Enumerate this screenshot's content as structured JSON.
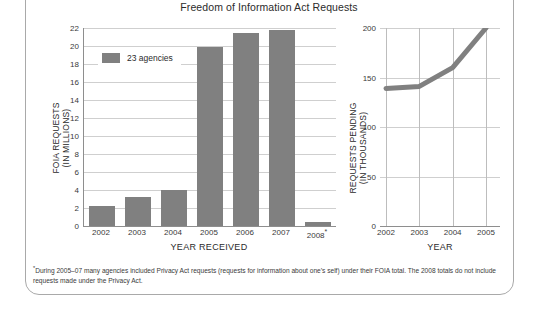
{
  "title": "Freedom of Information Act Requests",
  "colors": {
    "bar": "#808080",
    "line": "#808080",
    "grid": "#cfcfcf",
    "axis": "#8e8e8e",
    "frame": "#a9a9a9",
    "text": "#2b2b2b"
  },
  "legend": {
    "label": "23 agencies"
  },
  "footnote": {
    "marker": "*",
    "text": "During 2005–07 many agencies included Privacy Act requests (requests for information about one’s self) under their FOIA total. The 2008 totals do not include requests made under the Privacy Act."
  },
  "chart_data": [
    {
      "type": "bar",
      "title": "FOIA Requests",
      "xlabel": "YEAR RECEIVED",
      "ylabel": "FOIA REQUESTS (IN MILLIONS)",
      "ylabel_lines": [
        "FOIA REQUESTS",
        "(IN MILLIONS)"
      ],
      "categories": [
        "2002",
        "2003",
        "2004",
        "2005",
        "2006",
        "2007",
        "2008*"
      ],
      "values": [
        2.2,
        3.2,
        4.0,
        19.9,
        21.4,
        21.8,
        0.5
      ],
      "ylim": [
        0,
        22
      ],
      "yticks": [
        0,
        2,
        4,
        6,
        8,
        10,
        12,
        14,
        16,
        18,
        20,
        22
      ],
      "grid": true,
      "legend_position": "top-left",
      "series": [
        {
          "name": "23 agencies",
          "values": [
            2.2,
            3.2,
            4.0,
            19.9,
            21.4,
            21.8,
            0.5
          ]
        }
      ],
      "annotations": [
        "2008 category carries an asterisk footnote"
      ]
    },
    {
      "type": "line",
      "title": "Requests Pending",
      "xlabel": "YEAR",
      "ylabel": "REQUESTS PENDING (IN THOUSANDS)",
      "ylabel_lines": [
        "REQUESTS PENDING",
        "(IN THOUSANDS)"
      ],
      "x": [
        "2002",
        "2003",
        "2004",
        "2005"
      ],
      "values": [
        139,
        141,
        160,
        200
      ],
      "ylim": [
        0,
        200
      ],
      "yticks": [
        0,
        50,
        100,
        150,
        200
      ],
      "grid": true,
      "legend_position": "none"
    }
  ]
}
